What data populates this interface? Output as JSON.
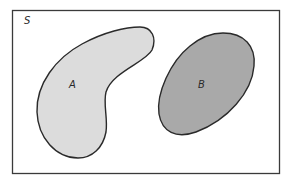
{
  "diagram": {
    "type": "venn",
    "universe": {
      "label": "S",
      "stroke": "#3a3a3a"
    },
    "sets": [
      {
        "id": "A",
        "label": "A",
        "fill": "#dcdcdc",
        "stroke": "#2a2a2a"
      },
      {
        "id": "B",
        "label": "B",
        "fill": "#a9a9a9",
        "stroke": "#2a2a2a"
      }
    ],
    "relation": "disjoint"
  }
}
